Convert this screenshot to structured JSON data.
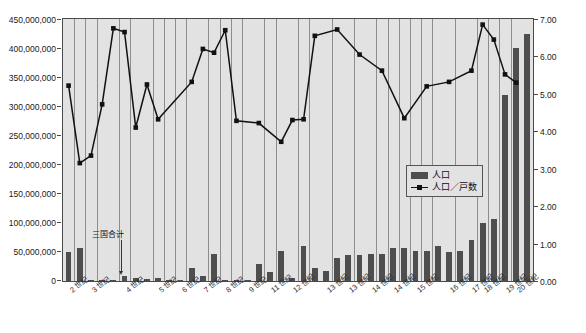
{
  "chart_data": {
    "type": "bar",
    "title": "",
    "subtitle": "",
    "xlabel": "",
    "ylabel": "",
    "y2label": "",
    "ylim": [
      0,
      450000000
    ],
    "y2lim": [
      0,
      7
    ],
    "grid": "vertical-group-separators",
    "legend_position": "inside-right",
    "y_ticks": [
      "0",
      "50,000,000",
      "100,000,000",
      "150,000,000",
      "200,000,000",
      "250,000,000",
      "300,000,000",
      "350,000,000",
      "400,000,000",
      "450,000,000"
    ],
    "y2_ticks": [
      "0.00",
      "1.00",
      "2.00",
      "3.00",
      "4.00",
      "5.00",
      "6.00",
      "7.00"
    ],
    "x_tick_labels": [
      "2 世紀",
      "3 世紀",
      "4 世紀",
      "5 世紀",
      "6 世紀",
      "7 世紀",
      "8 世紀",
      "9 世紀",
      "11 世紀",
      "12 世紀",
      "13 世紀",
      "13 世紀",
      "14 世紀",
      "14 世紀",
      "15 世紀",
      "16 世紀",
      "17 世紀",
      "18 世紀",
      "19 世紀",
      "20 世紀"
    ],
    "annotations": [
      {
        "text": "三国合计",
        "target_index": 9
      }
    ],
    "series": [
      {
        "name": "人口",
        "type": "bar",
        "axis": "left",
        "color": "#4e4e4e",
        "values": [
          49000000,
          56000000,
          1500000,
          2500000,
          2000000,
          8000000,
          5000000,
          3500000,
          4500000,
          1200000,
          1500000,
          22000000,
          9000000,
          46000000,
          2500000,
          2000000,
          1500000,
          30000000,
          15000000,
          52000000,
          5000000,
          60000000,
          22000000,
          17000000,
          40000000,
          45000000,
          44000000,
          46000000,
          46000000,
          57000000,
          57000000,
          52000000,
          52000000,
          60000000,
          50000000,
          51000000,
          71000000,
          100000000,
          106000000,
          320000000,
          400000000,
          425000000
        ]
      },
      {
        "name": "人口／戸数",
        "type": "line",
        "axis": "right",
        "color": "#111111",
        "marker": "square",
        "values": [
          5.22,
          3.15,
          3.35,
          4.72,
          6.75,
          6.65,
          4.1,
          5.25,
          4.32,
          5.32,
          6.2,
          6.1,
          6.7,
          4.28,
          4.22,
          3.72,
          4.3,
          4.32,
          6.55,
          6.72,
          6.05,
          5.62,
          4.35,
          5.2,
          5.32,
          5.62,
          6.85,
          6.45,
          5.52,
          5.3
        ]
      }
    ]
  },
  "legend": {
    "items": [
      {
        "label": "人口"
      },
      {
        "label": "人口／戸数"
      }
    ]
  },
  "annotation": {
    "three_kingdoms_total": "三国合计"
  },
  "axes": {
    "left_max_label": "450,000,000",
    "right_max_label": "7.00"
  },
  "topnote": {
    "text": ""
  }
}
